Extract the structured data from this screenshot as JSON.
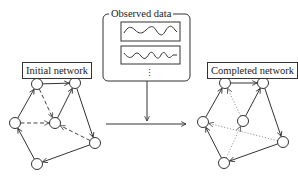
{
  "observed_data": {
    "title": "Observed data",
    "series_count_visible": 2,
    "continuation": "⋮"
  },
  "initial_network": {
    "label": "Initial network",
    "nodes": [
      {
        "id": "A",
        "x": 37,
        "y": 84
      },
      {
        "id": "B",
        "x": 75,
        "y": 83
      },
      {
        "id": "C",
        "x": 15,
        "y": 123
      },
      {
        "id": "D",
        "x": 55,
        "y": 123
      },
      {
        "id": "E",
        "x": 95,
        "y": 143
      },
      {
        "id": "F",
        "x": 37,
        "y": 164
      }
    ],
    "edges": [
      {
        "from": "A",
        "to": "B",
        "style": "solid"
      },
      {
        "from": "C",
        "to": "A",
        "style": "solid"
      },
      {
        "from": "D",
        "to": "B",
        "style": "solid"
      },
      {
        "from": "B",
        "to": "E",
        "style": "solid"
      },
      {
        "from": "E",
        "to": "F",
        "style": "solid"
      },
      {
        "from": "F",
        "to": "C",
        "style": "solid"
      },
      {
        "from": "A",
        "to": "D",
        "style": "dashed"
      },
      {
        "from": "C",
        "to": "D",
        "style": "dashed"
      },
      {
        "from": "E",
        "to": "D",
        "style": "dashed"
      }
    ]
  },
  "completed_network": {
    "label": "Completed network",
    "nodes": [
      {
        "id": "A",
        "x": 225,
        "y": 83
      },
      {
        "id": "B",
        "x": 263,
        "y": 83
      },
      {
        "id": "C",
        "x": 203,
        "y": 122
      },
      {
        "id": "D",
        "x": 243,
        "y": 121
      },
      {
        "id": "E",
        "x": 283,
        "y": 142
      },
      {
        "id": "F",
        "x": 224,
        "y": 163
      }
    ],
    "edges": [
      {
        "from": "A",
        "to": "B",
        "style": "solid"
      },
      {
        "from": "C",
        "to": "A",
        "style": "solid"
      },
      {
        "from": "D",
        "to": "B",
        "style": "solid"
      },
      {
        "from": "B",
        "to": "E",
        "style": "solid"
      },
      {
        "from": "E",
        "to": "F",
        "style": "solid"
      },
      {
        "from": "F",
        "to": "C",
        "style": "solid"
      },
      {
        "from": "D",
        "to": "A",
        "style": "dotted"
      },
      {
        "from": "E",
        "to": "C",
        "style": "dotted"
      },
      {
        "from": "F",
        "to": "D",
        "style": "dotted"
      }
    ]
  },
  "colors": {
    "stroke": "#333333",
    "dotted": "#999999",
    "background": "#ffffff"
  }
}
